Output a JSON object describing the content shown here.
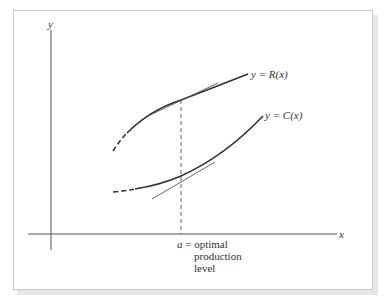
{
  "figure": {
    "axes": {
      "x_label": "x",
      "y_label": "y"
    },
    "curves": [
      {
        "name": "revenue",
        "label": "y = R(x)",
        "color": "#333333"
      },
      {
        "name": "cost",
        "label": "y = C(x)",
        "color": "#333333"
      }
    ],
    "annotation": {
      "line1": "a = optimal",
      "line2": "production",
      "line3": "level"
    }
  }
}
